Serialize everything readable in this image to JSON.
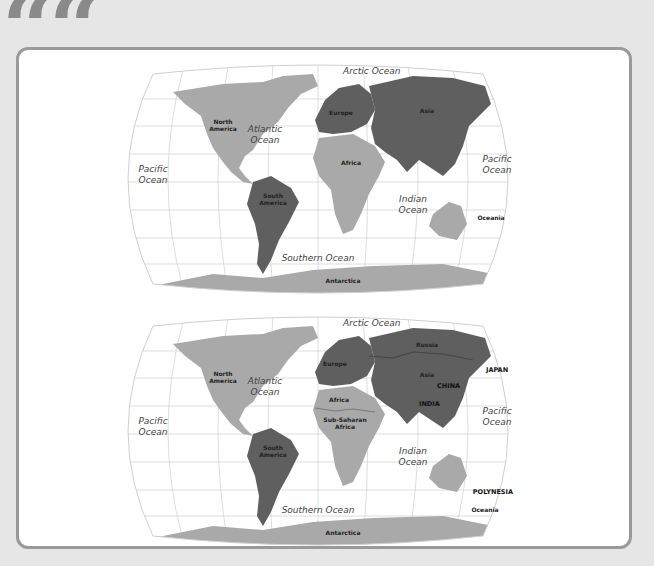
{
  "decoration": {
    "quote_mark": "““"
  },
  "colors": {
    "background": "#e6e6e6",
    "card_border": "#9a9a9a",
    "land_light": "#a9a9a9",
    "land_dark": "#5f5f5f",
    "grid": "#cfcfcf"
  },
  "maps": [
    {
      "name": "continents-map",
      "oceans": {
        "arctic": "Arctic Ocean",
        "atlantic_1": "Atlantic",
        "atlantic_2": "Ocean",
        "pacific_w_1": "Pacific",
        "pacific_w_2": "Ocean",
        "pacific_e_1": "Pacific",
        "pacific_e_2": "Ocean",
        "indian_1": "Indian",
        "indian_2": "Ocean",
        "southern": "Southern Ocean"
      },
      "continents": {
        "north_america_1": "North",
        "north_america_2": "America",
        "south_america_1": "South",
        "south_america_2": "America",
        "europe": "Europe",
        "asia": "Asia",
        "africa": "Africa",
        "oceania": "Oceania",
        "antarctica": "Antarctica"
      }
    },
    {
      "name": "regions-map",
      "oceans": {
        "arctic": "Arctic Ocean",
        "atlantic_1": "Atlantic",
        "atlantic_2": "Ocean",
        "pacific_w_1": "Pacific",
        "pacific_w_2": "Ocean",
        "pacific_e_1": "Pacific",
        "pacific_e_2": "Ocean",
        "indian_1": "Indian",
        "indian_2": "Ocean",
        "southern": "Southern Ocean"
      },
      "continents": {
        "north_america_1": "North",
        "north_america_2": "America",
        "south_america_1": "South",
        "south_america_2": "America",
        "europe": "Europe",
        "russia": "Russia",
        "asia": "Asia",
        "africa": "Africa",
        "sub_saharan_1": "Sub-Saharan",
        "sub_saharan_2": "Africa",
        "oceania": "Oceania",
        "antarctica": "Antarctica"
      },
      "countries": {
        "japan": "JAPAN",
        "china": "CHINA",
        "india": "INDIA",
        "polynesia": "POLYNESIA"
      }
    }
  ]
}
